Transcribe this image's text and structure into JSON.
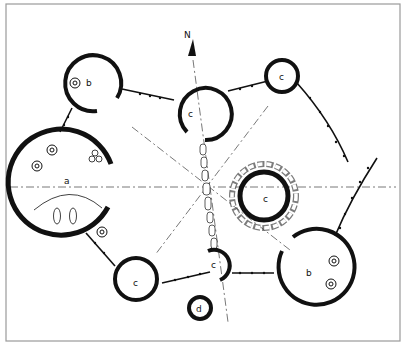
{
  "diagram": {
    "north_label": "N",
    "labels": {
      "a": "a",
      "b_top": "b",
      "b_bottom": "b",
      "c_top_center": "c",
      "c_top_right": "c",
      "c_center_right": "c",
      "c_bottom_left": "c",
      "c_small_center": "c",
      "d": "d"
    },
    "colors": {
      "ink": "#111111",
      "frame": "#9a9a9a",
      "axis": "#555555",
      "background": "#ffffff"
    }
  }
}
